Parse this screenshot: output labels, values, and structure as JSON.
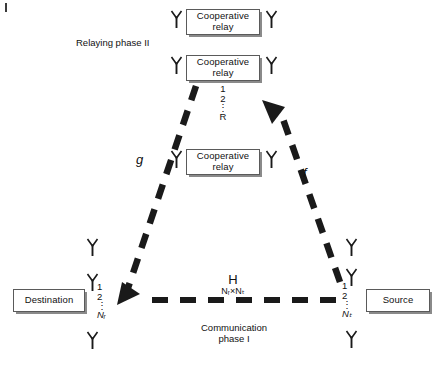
{
  "figure": {
    "title_labels": {
      "relaying_phase": "Relaying phase II",
      "communication_phase_line1": "Communication",
      "communication_phase_line2": "phase I"
    },
    "channel_labels": {
      "relay_to_destination": "g",
      "source_to_relay": "f",
      "direct_matrix": "H",
      "direct_matrix_dims": "Nᵣ×Nₜ"
    }
  },
  "nodes": {
    "destination": {
      "label": "Destination",
      "antenna_indices": [
        "1",
        "2",
        "⋮",
        "Nᵣ"
      ],
      "antenna_icon": "antenna-icon"
    },
    "source": {
      "label": "Source",
      "antenna_indices": [
        "1",
        "2",
        "⋮",
        "Nₜ"
      ],
      "antenna_icon": "antenna-icon"
    },
    "relays": [
      {
        "label_line1": "Cooperative",
        "label_line2": "relay"
      },
      {
        "label_line1": "Cooperative",
        "label_line2": "relay"
      },
      {
        "label_line1": "Cooperative",
        "label_line2": "relay"
      }
    ],
    "relay_indices": [
      "1",
      "2",
      "⋮",
      "R"
    ]
  },
  "colors": {
    "stroke": "#1a1a1a",
    "box_border": "#5a5a5a",
    "box_shadow": "#8a8a8a",
    "text": "#111111",
    "background": "#ffffff"
  }
}
